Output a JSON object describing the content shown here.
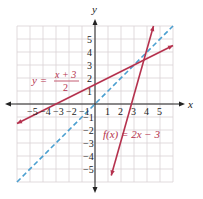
{
  "chart_data": {
    "type": "line",
    "title": "",
    "xlabel": "x",
    "ylabel": "y",
    "xlim": [
      -6,
      6
    ],
    "ylim": [
      -6,
      6
    ],
    "grid": true,
    "x_ticks": [
      "−5",
      "−4",
      "−3",
      "−2",
      "−1",
      "1",
      "2",
      "3",
      "4",
      "5"
    ],
    "y_ticks": [
      "5",
      "4",
      "3",
      "2",
      "1",
      "−1",
      "−2",
      "−3",
      "−4",
      "−5"
    ],
    "series": [
      {
        "name": "f(x) = 2x − 3",
        "style": "solid",
        "color": "#b5324e",
        "x": [
          1.25,
          4.5
        ],
        "y": [
          -5.5,
          6
        ]
      },
      {
        "name": "y = (x + 3)/2",
        "style": "solid",
        "color": "#b5324e",
        "x": [
          -6,
          6
        ],
        "y": [
          -1.5,
          4.5
        ]
      },
      {
        "name": "y = x",
        "style": "dashed",
        "color": "#4a9fd0",
        "x": [
          -6,
          6
        ],
        "y": [
          -6,
          6
        ]
      }
    ],
    "annotations": [
      {
        "text": "y =",
        "frac_num": "x + 3",
        "frac_den": "2",
        "position": "left-middle"
      },
      {
        "text": "f(x) = 2x − 3",
        "position": "lower-right"
      }
    ],
    "intersection": {
      "x": 3,
      "y": 3
    }
  },
  "labels": {
    "x_axis": "x",
    "y_axis": "y",
    "eq1_prefix": "y =",
    "eq1_num": "x + 3",
    "eq1_den": "2",
    "eq2": "f(x) = 2x − 3"
  },
  "colors": {
    "grid": "#d9d2d4",
    "axis": "#222222",
    "red_line": "#b5324e",
    "blue_line": "#4a9fd0",
    "label_red": "#b5324e"
  }
}
